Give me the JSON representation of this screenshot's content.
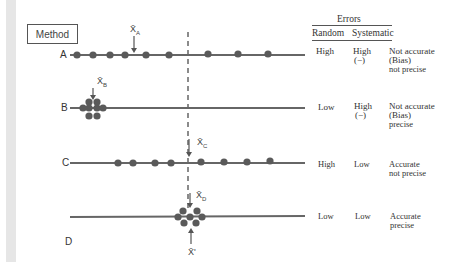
{
  "method_label": "Method",
  "table": {
    "group_header": "Errors",
    "col_random": "Random",
    "col_systematic": "Systematic"
  },
  "rows": [
    {
      "label": "A",
      "mean_label": "X̄",
      "mean_sub": "A",
      "random": "High",
      "systematic": "High",
      "systematic_sign": "(−)",
      "desc_line1": "Not accurate",
      "desc_line2": "(Bias)",
      "desc_line3": "not precise"
    },
    {
      "label": "B",
      "mean_label": "X̄",
      "mean_sub": "B",
      "random": "Low",
      "systematic": "High",
      "systematic_sign": "(−)",
      "desc_line1": "Not accurate",
      "desc_line2": "(Bias)",
      "desc_line3": "precise"
    },
    {
      "label": "C",
      "mean_label": "X̄",
      "mean_sub": "C",
      "random": "High",
      "systematic": "Low",
      "desc_line1": "Accurate",
      "desc_line2": "not precise"
    },
    {
      "label": "D",
      "mean_label": "X̄",
      "mean_sub": "D",
      "random": "Low",
      "systematic": "Low",
      "desc_line1": "Accurate",
      "desc_line2": "precise"
    }
  ],
  "true_value_label": "X̄'",
  "colors": {
    "line": "#666666",
    "dot": "#5a5a5a",
    "sidebar": "#e6e6e6"
  }
}
